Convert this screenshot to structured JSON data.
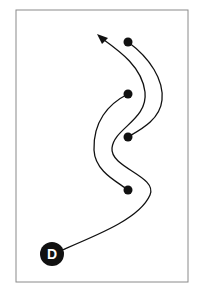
{
  "diagram": {
    "start_label": "D",
    "colors": {
      "frame": "#8a8a8a",
      "stroke": "#111111",
      "dot": "#111111",
      "label_text": "#ffffff"
    },
    "nodes": [
      {
        "id": "dot-1",
        "x": 128,
        "y": 42
      },
      {
        "id": "dot-2",
        "x": 128,
        "y": 94
      },
      {
        "id": "dot-3",
        "x": 128,
        "y": 137
      },
      {
        "id": "dot-4",
        "x": 128,
        "y": 190
      }
    ]
  }
}
